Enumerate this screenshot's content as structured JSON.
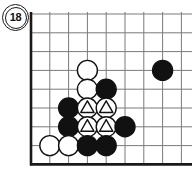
{
  "figure": {
    "label": "18",
    "label_name": "diagram-number-badge"
  },
  "board": {
    "type": "go-board-corner",
    "grid": {
      "origin_x": 31,
      "origin_y": 14,
      "spacing": 18.8,
      "cols_visible": 9,
      "rows_visible": 9,
      "left_edge": true,
      "bottom_edge": true,
      "top_edge": false,
      "right_edge": false,
      "line_color": "#7a7a7a",
      "edge_color": "#1a1a1a",
      "background": "#ffffff"
    },
    "stone_style": {
      "radius": 10,
      "black_fill": "#111111",
      "white_fill": "#ffffff",
      "outline": "#111111",
      "mark_shape": "triangle"
    },
    "stones": [
      {
        "id": "w-c3-r3",
        "color": "white",
        "col": 3,
        "row": 3,
        "mark": ""
      },
      {
        "id": "b-c7-r3",
        "color": "black",
        "col": 7,
        "row": 3,
        "mark": ""
      },
      {
        "id": "w-c3-r4",
        "color": "white",
        "col": 3,
        "row": 4,
        "mark": ""
      },
      {
        "id": "b-c4-r4",
        "color": "black",
        "col": 4,
        "row": 4,
        "mark": ""
      },
      {
        "id": "b-c2-r5",
        "color": "black",
        "col": 2,
        "row": 5,
        "mark": ""
      },
      {
        "id": "w-c3-r5",
        "color": "white",
        "col": 3,
        "row": 5,
        "mark": "triangle"
      },
      {
        "id": "w-c4-r5",
        "color": "white",
        "col": 4,
        "row": 5,
        "mark": "triangle"
      },
      {
        "id": "b-c2-r6",
        "color": "black",
        "col": 2,
        "row": 6,
        "mark": ""
      },
      {
        "id": "w-c3-r6",
        "color": "white",
        "col": 3,
        "row": 6,
        "mark": "triangle"
      },
      {
        "id": "w-c4-r6",
        "color": "white",
        "col": 4,
        "row": 6,
        "mark": "triangle"
      },
      {
        "id": "b-c5-r6",
        "color": "black",
        "col": 5,
        "row": 6,
        "mark": ""
      },
      {
        "id": "w-c1-r7",
        "color": "white",
        "col": 1,
        "row": 7,
        "mark": ""
      },
      {
        "id": "w-c2-r7",
        "color": "white",
        "col": 2,
        "row": 7,
        "mark": ""
      },
      {
        "id": "b-c3-r7",
        "color": "black",
        "col": 3,
        "row": 7,
        "mark": ""
      },
      {
        "id": "b-c4-r7",
        "color": "black",
        "col": 4,
        "row": 7,
        "mark": ""
      }
    ]
  }
}
